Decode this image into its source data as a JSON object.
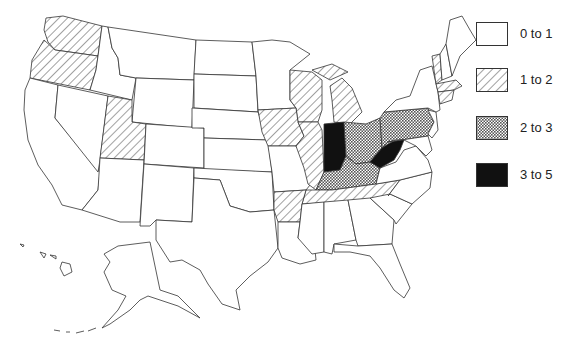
{
  "map": {
    "type": "choropleth",
    "region": "United States",
    "legend": [
      {
        "label": "0 to 1",
        "pattern": "blank"
      },
      {
        "label": "1 to 2",
        "pattern": "diagonal-hatch"
      },
      {
        "label": "2 to 3",
        "pattern": "crosshatch"
      },
      {
        "label": "3 to 5",
        "pattern": "solid-black"
      }
    ],
    "states": {
      "3 to 5": [
        "Indiana",
        "West Virginia"
      ],
      "2 to 3": [
        "Ohio",
        "Pennsylvania",
        "Kentucky"
      ],
      "1 to 2": [
        "Washington",
        "Oregon",
        "Utah",
        "Iowa",
        "Wisconsin",
        "Michigan",
        "Illinois",
        "Arkansas",
        "Tennessee",
        "Vermont",
        "Massachusetts",
        "Connecticut"
      ],
      "0 to 1": [
        "all other states"
      ]
    }
  },
  "colors": {
    "outline": "#333333",
    "solid": "#111111",
    "background": "#ffffff"
  }
}
